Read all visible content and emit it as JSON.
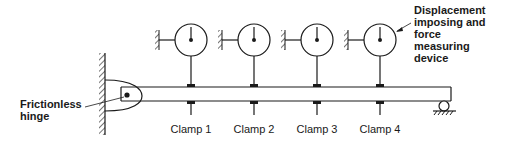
{
  "diagram": {
    "type": "mechanical schematic",
    "labels": {
      "hinge": [
        "Frictionless",
        "hinge"
      ],
      "device": [
        "Displacement",
        "imposing and",
        "force",
        "measuring",
        "device"
      ],
      "clamps": [
        "Clamp 1",
        "Clamp 2",
        "Clamp 3",
        "Clamp 4"
      ]
    },
    "colors": {
      "stroke": "#1a1a1a",
      "background": "#ffffff"
    }
  }
}
